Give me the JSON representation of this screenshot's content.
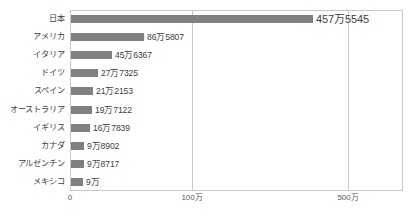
{
  "chart_data": {
    "type": "bar",
    "orientation": "horizontal",
    "title": "",
    "xlabel": "",
    "ylabel": "",
    "categories": [
      "日本",
      "アメリカ",
      "イタリア",
      "ドイツ",
      "スペイン",
      "オーストラリア",
      "イギリス",
      "カナダ",
      "アルゼンチン",
      "メキシコ"
    ],
    "values": [
      4575545,
      865807,
      456367,
      277325,
      212153,
      197122,
      167839,
      98902,
      98717,
      90000
    ],
    "value_labels": [
      "457万5545",
      "86万5807",
      "45万6367",
      "27万7325",
      "21万2153",
      "19万7122",
      "16万7839",
      "9万8902",
      "9万8717",
      "9万"
    ],
    "bar_pixel_widths": [
      242,
      73,
      41,
      27,
      22,
      21,
      19,
      13,
      13,
      12
    ],
    "axis": {
      "ticks": [
        {
          "label": "0",
          "value": 0,
          "x": 70
        },
        {
          "label": "100万",
          "value": 1000000,
          "x": 192
        },
        {
          "label": "500万",
          "value": 5000000,
          "x": 348
        }
      ],
      "grid": true,
      "scale_note": "non-linear / compressed above 100万"
    },
    "legend": {
      "visible": false,
      "position": "none"
    },
    "colors": {
      "bar": "#808080",
      "grid": "#c8c8c8",
      "border": "#c8c8c8",
      "text": "#404040",
      "background": "#ffffff"
    }
  }
}
